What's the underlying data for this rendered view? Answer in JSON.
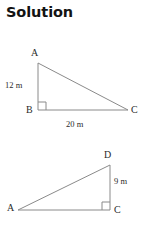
{
  "page": {
    "title": "Solution",
    "background_color": "#ffffff",
    "line_color": "#8a8a8a",
    "text_color": "#2b2b2b",
    "title_color": "#131313"
  },
  "figures": [
    {
      "id": "triangle-abc",
      "shape": "right-triangle",
      "right_angle_at": "B",
      "vertices": [
        {
          "name": "A",
          "label": "A",
          "x": 38,
          "y": 63
        },
        {
          "name": "B",
          "label": "B",
          "x": 38,
          "y": 110
        },
        {
          "name": "C",
          "label": "C",
          "x": 128,
          "y": 110
        }
      ],
      "sides": [
        {
          "name": "AB",
          "label": "12 m",
          "value": 12,
          "unit": "m"
        },
        {
          "name": "BC",
          "label": "20 m",
          "value": 20,
          "unit": "m"
        },
        {
          "name": "AC",
          "label": "",
          "value": null,
          "unit": "m"
        }
      ]
    },
    {
      "id": "triangle-adc",
      "shape": "right-triangle",
      "right_angle_at": "C",
      "vertices": [
        {
          "name": "A",
          "label": "A",
          "x": 18,
          "y": 210
        },
        {
          "name": "D",
          "label": "D",
          "x": 110,
          "y": 165
        },
        {
          "name": "C",
          "label": "C",
          "x": 110,
          "y": 210
        }
      ],
      "sides": [
        {
          "name": "DC",
          "label": "9 m",
          "value": 9,
          "unit": "m"
        },
        {
          "name": "AC",
          "label": "",
          "value": null,
          "unit": "m"
        },
        {
          "name": "AD",
          "label": "",
          "value": null,
          "unit": "m"
        }
      ]
    }
  ],
  "labels": {
    "t1_A": "A",
    "t1_B": "B",
    "t1_C": "C",
    "t1_leg_vertical": "12 m",
    "t1_leg_base": "20 m",
    "t2_A": "A",
    "t2_D": "D",
    "t2_C": "C",
    "t2_leg_vertical": "9 m"
  }
}
